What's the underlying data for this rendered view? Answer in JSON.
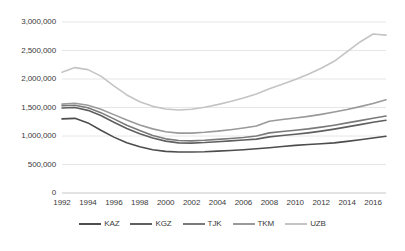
{
  "chart_data": {
    "type": "line",
    "title": "",
    "xlabel": "",
    "ylabel": "",
    "grid": true,
    "legend_position": "bottom",
    "xlim": [
      1992,
      2017
    ],
    "ylim": [
      0,
      3000000
    ],
    "ytick_labels": [
      "3,000,000",
      "2,500,000",
      "2,000,000",
      "1,500,000",
      "1,000,000",
      "500,000",
      "0"
    ],
    "ytick_values": [
      3000000,
      2500000,
      2000000,
      1500000,
      1000000,
      500000,
      0
    ],
    "xtick_labels": [
      "1992",
      "1994",
      "1996",
      "1998",
      "2000",
      "2002",
      "2004",
      "2006",
      "2008",
      "2010",
      "2012",
      "2014",
      "2016"
    ],
    "xtick_values": [
      1992,
      1994,
      1996,
      1998,
      2000,
      2002,
      2004,
      2006,
      2008,
      2010,
      2012,
      2014,
      2016
    ],
    "x": [
      1992,
      1993,
      1994,
      1995,
      1996,
      1997,
      1998,
      1999,
      2000,
      2001,
      2002,
      2003,
      2004,
      2005,
      2006,
      2007,
      2008,
      2009,
      2010,
      2011,
      2012,
      2013,
      2014,
      2015,
      2016,
      2017
    ],
    "series": [
      {
        "name": "KAZ",
        "color": "#4d4d4d",
        "values": [
          1300000,
          1310000,
          1230000,
          1100000,
          980000,
          880000,
          810000,
          760000,
          730000,
          720000,
          720000,
          725000,
          735000,
          745000,
          760000,
          775000,
          795000,
          815000,
          835000,
          850000,
          865000,
          880000,
          905000,
          935000,
          965000,
          995000
        ]
      },
      {
        "name": "KGZ",
        "color": "#5f5f5f",
        "values": [
          1490000,
          1500000,
          1450000,
          1360000,
          1240000,
          1130000,
          1040000,
          965000,
          910000,
          880000,
          875000,
          885000,
          900000,
          915000,
          930000,
          945000,
          985000,
          1010000,
          1030000,
          1055000,
          1085000,
          1120000,
          1160000,
          1200000,
          1240000,
          1275000
        ]
      },
      {
        "name": "TJK",
        "color": "#7a7a7a",
        "values": [
          1530000,
          1540000,
          1495000,
          1410000,
          1300000,
          1190000,
          1095000,
          1010000,
          950000,
          920000,
          915000,
          925000,
          940000,
          955000,
          975000,
          1000000,
          1055000,
          1080000,
          1100000,
          1125000,
          1155000,
          1190000,
          1230000,
          1270000,
          1310000,
          1350000
        ]
      },
      {
        "name": "TKM",
        "color": "#9a9a9a",
        "values": [
          1560000,
          1575000,
          1540000,
          1470000,
          1375000,
          1280000,
          1195000,
          1125000,
          1075000,
          1050000,
          1050000,
          1065000,
          1085000,
          1110000,
          1140000,
          1175000,
          1260000,
          1290000,
          1315000,
          1345000,
          1380000,
          1420000,
          1465000,
          1515000,
          1570000,
          1635000
        ]
      },
      {
        "name": "UZB",
        "color": "#c4c4c4",
        "values": [
          2120000,
          2200000,
          2165000,
          2050000,
          1880000,
          1720000,
          1600000,
          1520000,
          1475000,
          1455000,
          1470000,
          1505000,
          1550000,
          1605000,
          1665000,
          1735000,
          1830000,
          1910000,
          1990000,
          2085000,
          2190000,
          2310000,
          2480000,
          2650000,
          2790000,
          2770000
        ]
      }
    ]
  },
  "legend": {
    "items": [
      {
        "label": "KAZ"
      },
      {
        "label": "KGZ"
      },
      {
        "label": "TJK"
      },
      {
        "label": "TKM"
      },
      {
        "label": "UZB"
      }
    ]
  },
  "footnote": {
    "text": ""
  }
}
